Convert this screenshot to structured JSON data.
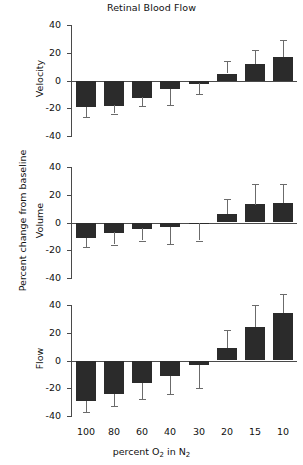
{
  "figure": {
    "title": "Retinal Blood Flow",
    "y_axis_label": "Percent change from baseline",
    "x_axis_title_parts": {
      "pre": "percent O",
      "sub1": "2",
      "mid": " in N",
      "sub2": "2"
    },
    "x_axis_title_text": "percent O2 in N2"
  },
  "chart_data": {
    "type": "bar",
    "title": "Retinal Blood Flow",
    "xlabel": "percent O2 in N2",
    "ylabel": "Percent change from baseline",
    "ylim": [
      -40,
      40
    ],
    "yticks": [
      40,
      20,
      0,
      -20,
      -40
    ],
    "ytick_labels": [
      "40",
      "20",
      "0",
      "-20",
      "-40"
    ],
    "grid": false,
    "legend": "none",
    "categories": [
      "100",
      "80",
      "60",
      "40",
      "30",
      "20",
      "15",
      "10"
    ],
    "panels": [
      {
        "name": "velocity",
        "label": "Velocity",
        "values": [
          -19,
          -18,
          -12,
          -6,
          -2,
          5,
          12,
          17
        ],
        "errors": [
          7.5,
          6,
          6.5,
          12,
          8,
          9,
          10,
          12
        ]
      },
      {
        "name": "volume",
        "label": "Volume",
        "values": [
          -11,
          -7,
          -4,
          -3,
          -0.5,
          6,
          13,
          14
        ],
        "errors": [
          7,
          9,
          9,
          12.5,
          12.5,
          11,
          15,
          14
        ]
      },
      {
        "name": "flow",
        "label": "Flow",
        "values": [
          -29,
          -24,
          -16,
          -11,
          -3,
          9,
          24,
          34
        ],
        "errors": [
          8,
          8.5,
          12,
          13,
          17,
          13,
          16,
          14
        ]
      }
    ]
  }
}
